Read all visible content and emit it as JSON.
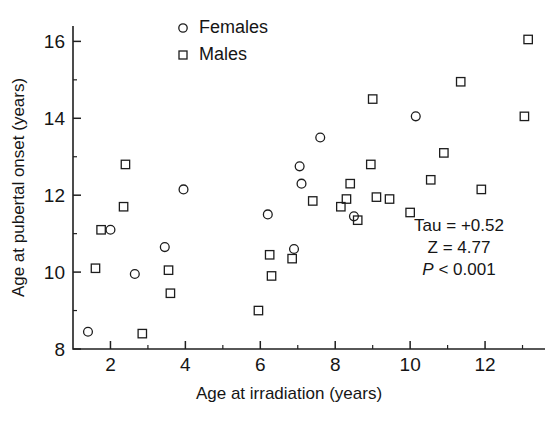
{
  "chart_data": {
    "type": "scatter",
    "title": "",
    "xlabel": "Age at irradiation (years)",
    "ylabel": "Age at pubertal onset (years)",
    "xlim": [
      1,
      13.6
    ],
    "ylim": [
      8,
      16.4
    ],
    "xticks": [
      2,
      4,
      6,
      8,
      10,
      12
    ],
    "yticks": [
      8,
      10,
      12,
      14,
      16
    ],
    "xminorticks": [
      3,
      5,
      7,
      9,
      11,
      13
    ],
    "yminorticks": [
      9,
      11,
      13,
      15
    ],
    "grid": false,
    "legend_position": "top-center",
    "series": [
      {
        "name": "Females",
        "marker": "circle",
        "points": [
          [
            1.4,
            8.45
          ],
          [
            2.0,
            11.1
          ],
          [
            2.65,
            9.95
          ],
          [
            3.45,
            10.65
          ],
          [
            3.95,
            12.15
          ],
          [
            6.2,
            11.5
          ],
          [
            6.9,
            10.6
          ],
          [
            7.05,
            12.75
          ],
          [
            7.1,
            12.3
          ],
          [
            7.6,
            13.5
          ],
          [
            8.5,
            11.45
          ],
          [
            10.15,
            14.05
          ]
        ]
      },
      {
        "name": "Males",
        "marker": "square",
        "points": [
          [
            1.6,
            10.1
          ],
          [
            1.75,
            11.1
          ],
          [
            2.35,
            11.7
          ],
          [
            2.4,
            12.8
          ],
          [
            2.85,
            8.4
          ],
          [
            3.55,
            10.05
          ],
          [
            3.6,
            9.45
          ],
          [
            5.95,
            9.0
          ],
          [
            6.25,
            10.45
          ],
          [
            6.3,
            9.9
          ],
          [
            6.85,
            10.35
          ],
          [
            7.4,
            11.85
          ],
          [
            8.15,
            11.7
          ],
          [
            8.3,
            11.9
          ],
          [
            8.6,
            11.35
          ],
          [
            8.4,
            12.3
          ],
          [
            8.95,
            12.8
          ],
          [
            9.1,
            11.95
          ],
          [
            9.45,
            11.9
          ],
          [
            9.0,
            14.5
          ],
          [
            10.0,
            11.55
          ],
          [
            10.55,
            12.4
          ],
          [
            10.9,
            13.1
          ],
          [
            11.35,
            14.95
          ],
          [
            11.9,
            12.15
          ],
          [
            13.05,
            14.05
          ],
          [
            13.15,
            16.05
          ]
        ]
      }
    ],
    "annotations": [
      {
        "id": "tau",
        "text": "Tau = +0.52",
        "italic": false
      },
      {
        "id": "z",
        "text": "Z = 4.77",
        "italic": false
      },
      {
        "id": "p",
        "text_italic": "P",
        "text": " < 0.001",
        "italic": true
      }
    ]
  },
  "legend": {
    "items": [
      {
        "label": "Females",
        "marker": "circle"
      },
      {
        "label": "Males",
        "marker": "square"
      }
    ]
  },
  "colors": {
    "ink": "#1d1d1d",
    "background": "#ffffff"
  }
}
